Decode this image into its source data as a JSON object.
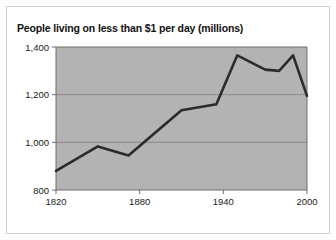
{
  "figure": {
    "background_color": "#ffffff",
    "border_color": "#cfcfcf"
  },
  "chart_data": {
    "type": "line",
    "title": "People living on less than $1 per day (millions)",
    "xlabel": "",
    "ylabel": "",
    "xlim": [
      1820,
      2000
    ],
    "ylim": [
      800,
      1400
    ],
    "xticks": [
      1820,
      1880,
      1940,
      2000
    ],
    "xtick_labels": [
      "1820",
      "1880",
      "1940",
      "2000"
    ],
    "yticks": [
      800,
      1000,
      1200,
      1400
    ],
    "ytick_labels": [
      "800",
      "1,000",
      "1,200",
      "1,400"
    ],
    "grid": "horizontal",
    "legend": "none",
    "plot_background_color": "#b3b3b3",
    "gridline_color": "#8a8a8a",
    "line_color": "#2b2b2b",
    "line_width": 2.6,
    "x": [
      1820,
      1850,
      1872,
      1910,
      1935,
      1950,
      1970,
      1980,
      1990,
      2000
    ],
    "values": [
      880,
      983,
      945,
      1135,
      1160,
      1365,
      1305,
      1300,
      1365,
      1195
    ],
    "series": [
      {
        "name": "People living on less than $1 per day (millions)",
        "points": [
          {
            "x": 1820,
            "y": 880
          },
          {
            "x": 1850,
            "y": 983
          },
          {
            "x": 1872,
            "y": 945
          },
          {
            "x": 1910,
            "y": 1135
          },
          {
            "x": 1935,
            "y": 1160
          },
          {
            "x": 1950,
            "y": 1365
          },
          {
            "x": 1970,
            "y": 1305
          },
          {
            "x": 1980,
            "y": 1300
          },
          {
            "x": 1990,
            "y": 1365
          },
          {
            "x": 2000,
            "y": 1195
          }
        ]
      }
    ]
  }
}
